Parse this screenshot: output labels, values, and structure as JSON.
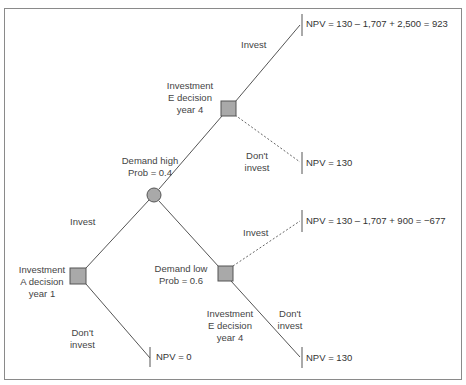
{
  "diagram": {
    "type": "decision-tree",
    "colors": {
      "node_fill": "#a9a9a9",
      "node_stroke": "#555555",
      "line": "#555555",
      "text": "#444444",
      "frame": "#8a8a8a"
    },
    "nodes": {
      "decision_a": {
        "kind": "decision",
        "label_lines": [
          "Investment",
          "A decision",
          "year 1"
        ]
      },
      "chance": {
        "kind": "chance"
      },
      "decision_e_high": {
        "kind": "decision",
        "label_lines": [
          "Investment",
          "E decision",
          "year 4"
        ]
      },
      "decision_e_low": {
        "kind": "decision",
        "label_lines": [
          "Investment",
          "E decision",
          "year 4"
        ]
      }
    },
    "branches": {
      "a_invest": "Invest",
      "a_dont_invest": [
        "Don't",
        "invest"
      ],
      "demand_high": [
        "Demand high",
        "Prob = 0.4"
      ],
      "demand_low": [
        "Demand low",
        "Prob = 0.6"
      ],
      "high_invest": "Invest",
      "high_dont_invest": [
        "Don't",
        "invest"
      ],
      "low_invest": "Invest",
      "low_dont_invest": [
        "Don't",
        "invest"
      ]
    },
    "outcomes": {
      "high_invest": "NPV = 130 – 1,707 + 2,500 = 923",
      "high_dont_invest": "NPV = 130",
      "low_invest": "NPV = 130 – 1,707 + 900 = −677",
      "low_dont_invest": "NPV = 130",
      "a_dont_invest": "NPV = 0"
    }
  }
}
